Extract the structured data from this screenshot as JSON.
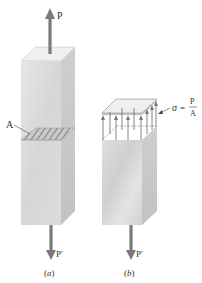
{
  "figure_a": {
    "force_top": "P",
    "force_bottom": "P'",
    "area_label": "A",
    "caption": "(a)"
  },
  "figure_b": {
    "force_bottom": "P'",
    "stress_symbol": "σ",
    "stress_equals": "=",
    "stress_numerator": "P",
    "stress_denominator": "A",
    "caption": "(b)"
  },
  "colors": {
    "arrow": "#7a7a7a",
    "bar_front": "#d9d9d9",
    "bar_side": "#c4c4c4",
    "bar_top": "#eeeeee",
    "hatch": "#6e6e6e",
    "text": "#333333"
  }
}
